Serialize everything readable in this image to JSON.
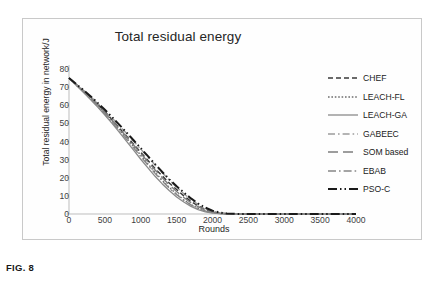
{
  "figure": {
    "caption": "FIG. 8"
  },
  "chart_data": {
    "type": "line",
    "title": "Total residual energy",
    "xlabel": "Rounds",
    "ylabel": "Total residual energy in network/J",
    "xlim": [
      0,
      4000
    ],
    "ylim": [
      0,
      80
    ],
    "xticks": [
      0,
      500,
      1000,
      1500,
      2000,
      2500,
      3000,
      3500,
      4000
    ],
    "yticks": [
      0,
      10,
      20,
      30,
      40,
      50,
      60,
      70,
      80
    ],
    "xtick_labels": [
      "0",
      "500",
      "1000",
      "1500",
      "2000",
      "2500",
      "3000",
      "3500",
      "4000"
    ],
    "ytick_labels": [
      "0",
      "10",
      "20",
      "30",
      "40",
      "50",
      "60",
      "70",
      "80"
    ],
    "grid": false,
    "legend_position": "right",
    "x": [
      0,
      100,
      200,
      300,
      400,
      500,
      600,
      700,
      800,
      900,
      1000,
      1100,
      1200,
      1300,
      1400,
      1500,
      1600,
      1700,
      1800,
      1900,
      2000,
      2100,
      2200,
      2300,
      2400,
      2500,
      3000,
      3500,
      4000
    ],
    "series": [
      {
        "name": "CHEF",
        "color": "#3a3a3a",
        "dash": "5,3",
        "width": 1.5,
        "values": [
          75,
          71.5,
          68,
          64.5,
          60.5,
          56.5,
          52,
          47.5,
          43,
          38.5,
          34,
          29.5,
          25,
          21,
          17,
          13.5,
          10,
          7,
          4.5,
          2.5,
          1.2,
          0.5,
          0.2,
          0.1,
          0,
          0,
          0,
          0,
          0
        ]
      },
      {
        "name": "LEACH-FL",
        "color": "#6e6e6e",
        "dash": "1.6,1.8",
        "width": 1.4,
        "values": [
          75,
          71.3,
          67.6,
          63.8,
          59.8,
          55.6,
          51.2,
          46.6,
          42,
          37.2,
          32.4,
          27.6,
          23,
          18.6,
          14.6,
          11,
          7.8,
          5.2,
          3.2,
          1.8,
          0.8,
          0.3,
          0.1,
          0,
          0,
          0,
          0,
          0,
          0
        ]
      },
      {
        "name": "LEACH-GA",
        "color": "#8a8a8a",
        "dash": "0",
        "width": 1.3,
        "values": [
          75,
          71,
          67.2,
          63.2,
          59,
          54.6,
          50,
          45.2,
          40.2,
          35.2,
          30.2,
          25.4,
          20.8,
          16.6,
          12.8,
          9.4,
          6.6,
          4.2,
          2.4,
          1.2,
          0.5,
          0.2,
          0,
          0,
          0,
          0,
          0,
          0,
          0
        ]
      },
      {
        "name": "GABEEC",
        "color": "#9c9c9c",
        "dash": "7,3,1.6,3",
        "width": 1.4,
        "values": [
          75,
          71.6,
          68.2,
          64.8,
          61,
          57.2,
          53,
          48.8,
          44.5,
          40.2,
          35.8,
          31.4,
          27,
          22.8,
          18.6,
          14.8,
          11.2,
          8,
          5.2,
          3,
          1.5,
          0.6,
          0.2,
          0.1,
          0,
          0,
          0,
          0,
          0
        ]
      },
      {
        "name": "SOM based",
        "color": "#7d7d7d",
        "dash": "10,5",
        "width": 1.4,
        "values": [
          75,
          71.4,
          67.8,
          64.1,
          60.2,
          56.1,
          51.7,
          47.2,
          42.7,
          38.1,
          33.4,
          28.8,
          24.3,
          20,
          16,
          12.4,
          9.1,
          6.3,
          4,
          2.3,
          1.1,
          0.4,
          0.1,
          0,
          0,
          0,
          0,
          0,
          0
        ]
      },
      {
        "name": "EBAB",
        "color": "#878787",
        "dash": "8,3,1.6,3",
        "width": 1.4,
        "values": [
          75,
          71.2,
          67.4,
          63.5,
          59.4,
          55.1,
          50.6,
          46,
          41.3,
          36.5,
          31.7,
          27,
          22.4,
          18.1,
          14.2,
          10.7,
          7.6,
          5,
          3,
          1.6,
          0.7,
          0.25,
          0.05,
          0,
          0,
          0,
          0,
          0,
          0
        ]
      },
      {
        "name": "PSO-C",
        "color": "#1a1a1a",
        "dash": "9,3,1.5,3,1.5,3",
        "width": 2.0,
        "values": [
          75,
          71.7,
          68.4,
          65,
          61.3,
          57.5,
          53.5,
          49.3,
          45,
          40.7,
          36.3,
          31.9,
          27.5,
          23.2,
          19.1,
          15.3,
          11.8,
          8.6,
          5.8,
          3.5,
          1.8,
          0.8,
          0.3,
          0.1,
          0,
          0,
          0,
          0,
          0
        ]
      }
    ]
  }
}
